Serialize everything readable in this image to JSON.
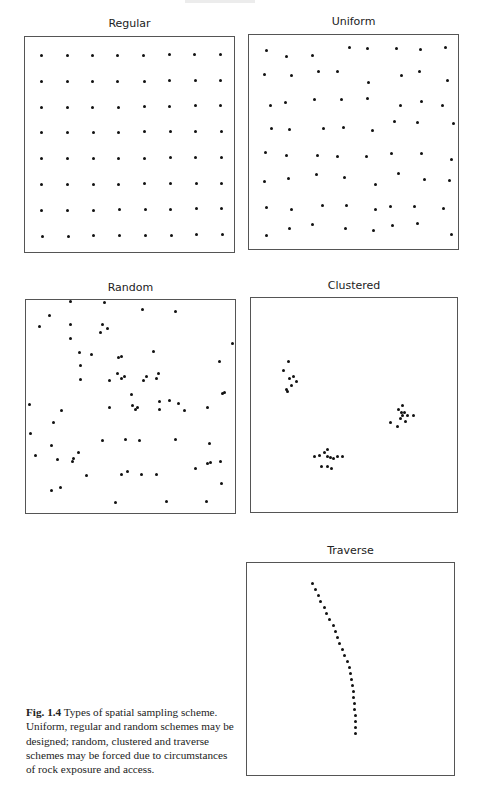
{
  "figure": {
    "caption_label": "Fig. 1.4",
    "caption_text": " Types of spatial sampling scheme. Uniform, regular and random schemes may be designed; random, clustered and traverse schemes may be forced due to circumstances of rock exposure and access."
  },
  "panels": [
    {
      "id": "regular",
      "title": "Regular",
      "box": {
        "x": 24,
        "y": 36,
        "w": 211,
        "h": 217
      },
      "title_pos": {
        "x": 24,
        "y": 17,
        "w": 211
      }
    },
    {
      "id": "uniform",
      "title": "Uniform",
      "box": {
        "x": 248,
        "y": 34,
        "w": 211,
        "h": 216
      },
      "title_pos": {
        "x": 248,
        "y": 15,
        "w": 211
      }
    },
    {
      "id": "random",
      "title": "Random",
      "box": {
        "x": 25,
        "y": 299,
        "w": 211,
        "h": 215
      },
      "title_pos": {
        "x": 25,
        "y": 281,
        "w": 211
      }
    },
    {
      "id": "clustered",
      "title": "Clustered",
      "box": {
        "x": 250,
        "y": 297,
        "w": 208,
        "h": 216
      },
      "title_pos": {
        "x": 250,
        "y": 279,
        "w": 208
      }
    },
    {
      "id": "traverse",
      "title": "Traverse",
      "box": {
        "x": 246,
        "y": 562,
        "w": 209,
        "h": 214
      },
      "title_pos": {
        "x": 246,
        "y": 544,
        "w": 209
      }
    }
  ],
  "chart_data": [
    {
      "type": "scatter",
      "title": "Regular",
      "grid": false,
      "points": [
        [
          40,
          54
        ],
        [
          66,
          54
        ],
        [
          91,
          54
        ],
        [
          116,
          54
        ],
        [
          142,
          54
        ],
        [
          168,
          53
        ],
        [
          193,
          53
        ],
        [
          219,
          53
        ],
        [
          40,
          80
        ],
        [
          66,
          80
        ],
        [
          91,
          80
        ],
        [
          116,
          80
        ],
        [
          143,
          80
        ],
        [
          168,
          79
        ],
        [
          194,
          79
        ],
        [
          219,
          79
        ],
        [
          40,
          106
        ],
        [
          66,
          106
        ],
        [
          91,
          106
        ],
        [
          117,
          106
        ],
        [
          143,
          105
        ],
        [
          168,
          105
        ],
        [
          194,
          104
        ],
        [
          219,
          104
        ],
        [
          40,
          131
        ],
        [
          66,
          131
        ],
        [
          92,
          131
        ],
        [
          117,
          131
        ],
        [
          143,
          130
        ],
        [
          169,
          130
        ],
        [
          194,
          130
        ],
        [
          220,
          130
        ],
        [
          40,
          157
        ],
        [
          66,
          157
        ],
        [
          92,
          157
        ],
        [
          117,
          157
        ],
        [
          143,
          157
        ],
        [
          169,
          156
        ],
        [
          194,
          156
        ],
        [
          220,
          156
        ],
        [
          40,
          183
        ],
        [
          66,
          183
        ],
        [
          92,
          183
        ],
        [
          117,
          183
        ],
        [
          143,
          182
        ],
        [
          169,
          182
        ],
        [
          195,
          182
        ],
        [
          220,
          182
        ],
        [
          40,
          209
        ],
        [
          66,
          209
        ],
        [
          92,
          209
        ],
        [
          118,
          208
        ],
        [
          144,
          208
        ],
        [
          169,
          208
        ],
        [
          195,
          207
        ],
        [
          220,
          207
        ],
        [
          41,
          235
        ],
        [
          67,
          235
        ],
        [
          92,
          234
        ],
        [
          118,
          234
        ],
        [
          144,
          234
        ],
        [
          170,
          234
        ],
        [
          195,
          233
        ],
        [
          221,
          233
        ]
      ]
    },
    {
      "type": "scatter",
      "title": "Uniform",
      "grid": false,
      "points": [
        [
          265,
          49
        ],
        [
          285,
          55
        ],
        [
          311,
          54
        ],
        [
          348,
          46
        ],
        [
          366,
          47
        ],
        [
          395,
          47
        ],
        [
          419,
          48
        ],
        [
          444,
          46
        ],
        [
          263,
          73
        ],
        [
          290,
          74
        ],
        [
          317,
          70
        ],
        [
          336,
          70
        ],
        [
          367,
          81
        ],
        [
          400,
          74
        ],
        [
          418,
          70
        ],
        [
          446,
          79
        ],
        [
          269,
          104
        ],
        [
          284,
          101
        ],
        [
          313,
          98
        ],
        [
          340,
          98
        ],
        [
          366,
          97
        ],
        [
          399,
          104
        ],
        [
          420,
          100
        ],
        [
          441,
          104
        ],
        [
          270,
          127
        ],
        [
          288,
          128
        ],
        [
          322,
          127
        ],
        [
          342,
          126
        ],
        [
          371,
          129
        ],
        [
          393,
          120
        ],
        [
          416,
          121
        ],
        [
          452,
          122
        ],
        [
          264,
          151
        ],
        [
          285,
          154
        ],
        [
          316,
          154
        ],
        [
          336,
          155
        ],
        [
          365,
          155
        ],
        [
          390,
          152
        ],
        [
          420,
          152
        ],
        [
          450,
          158
        ],
        [
          263,
          180
        ],
        [
          287,
          177
        ],
        [
          315,
          173
        ],
        [
          343,
          176
        ],
        [
          374,
          183
        ],
        [
          397,
          172
        ],
        [
          423,
          178
        ],
        [
          448,
          179
        ],
        [
          265,
          206
        ],
        [
          290,
          208
        ],
        [
          321,
          204
        ],
        [
          345,
          204
        ],
        [
          374,
          208
        ],
        [
          389,
          205
        ],
        [
          413,
          205
        ],
        [
          442,
          207
        ],
        [
          265,
          234
        ],
        [
          288,
          227
        ],
        [
          311,
          223
        ],
        [
          344,
          227
        ],
        [
          372,
          229
        ],
        [
          391,
          224
        ],
        [
          416,
          222
        ],
        [
          450,
          233
        ]
      ]
    },
    {
      "type": "scatter",
      "title": "Random",
      "grid": false,
      "points": [
        [
          69,
          300
        ],
        [
          103,
          301
        ],
        [
          48,
          314
        ],
        [
          141,
          308
        ],
        [
          174,
          310
        ],
        [
          38,
          325
        ],
        [
          69,
          323
        ],
        [
          101,
          323
        ],
        [
          106,
          327
        ],
        [
          99,
          331
        ],
        [
          69,
          337
        ],
        [
          231,
          342
        ],
        [
          78,
          351
        ],
        [
          90,
          353
        ],
        [
          117,
          356
        ],
        [
          120,
          355
        ],
        [
          152,
          350
        ],
        [
          116,
          372
        ],
        [
          79,
          364
        ],
        [
          79,
          378
        ],
        [
          120,
          377
        ],
        [
          123,
          375
        ],
        [
          145,
          375
        ],
        [
          142,
          379
        ],
        [
          218,
          360
        ],
        [
          108,
          379
        ],
        [
          130,
          393
        ],
        [
          155,
          377
        ],
        [
          157,
          372
        ],
        [
          221,
          392
        ],
        [
          223,
          391
        ],
        [
          28,
          403
        ],
        [
          60,
          409
        ],
        [
          108,
          406
        ],
        [
          131,
          404
        ],
        [
          134,
          408
        ],
        [
          136,
          406
        ],
        [
          158,
          400
        ],
        [
          158,
          408
        ],
        [
          168,
          399
        ],
        [
          183,
          409
        ],
        [
          177,
          402
        ],
        [
          206,
          406
        ],
        [
          52,
          421
        ],
        [
          29,
          432
        ],
        [
          101,
          439
        ],
        [
          124,
          438
        ],
        [
          138,
          439
        ],
        [
          174,
          438
        ],
        [
          208,
          442
        ],
        [
          50,
          444
        ],
        [
          77,
          451
        ],
        [
          72,
          457
        ],
        [
          34,
          454
        ],
        [
          71,
          460
        ],
        [
          56,
          458
        ],
        [
          85,
          474
        ],
        [
          120,
          473
        ],
        [
          126,
          470
        ],
        [
          140,
          473
        ],
        [
          155,
          473
        ],
        [
          194,
          467
        ],
        [
          206,
          462
        ],
        [
          209,
          461
        ],
        [
          219,
          460
        ],
        [
          220,
          482
        ],
        [
          50,
          489
        ],
        [
          59,
          486
        ],
        [
          114,
          501
        ],
        [
          165,
          500
        ],
        [
          205,
          500
        ]
      ]
    },
    {
      "type": "scatter",
      "title": "Clustered",
      "grid": false,
      "clusters": [
        {
          "name": "upper-left",
          "points": [
            [
              287,
              360
            ],
            [
              282,
              369
            ],
            [
              288,
              377
            ],
            [
              292,
              375
            ],
            [
              295,
              380
            ],
            [
              290,
              384
            ],
            [
              285,
              388
            ],
            [
              286,
              390
            ]
          ]
        },
        {
          "name": "right",
          "points": [
            [
              401,
              404
            ],
            [
              397,
              408
            ],
            [
              400,
              411
            ],
            [
              403,
              411
            ],
            [
              401,
              414
            ],
            [
              406,
              414
            ],
            [
              412,
              414
            ],
            [
              389,
              421
            ],
            [
              396,
              425
            ],
            [
              404,
              420
            ],
            [
              399,
              417
            ]
          ]
        },
        {
          "name": "lower-middle",
          "points": [
            [
              326,
              448
            ],
            [
              323,
              451
            ],
            [
              313,
              455
            ],
            [
              318,
              454
            ],
            [
              326,
              455
            ],
            [
              329,
              456
            ],
            [
              332,
              457
            ],
            [
              336,
              455
            ],
            [
              341,
              455
            ],
            [
              320,
              465
            ],
            [
              326,
              465
            ],
            [
              330,
              467
            ]
          ]
        }
      ]
    },
    {
      "type": "scatter",
      "title": "Traverse",
      "grid": false,
      "points": [
        [
          311,
          582
        ],
        [
          314,
          588
        ],
        [
          317,
          594
        ],
        [
          319,
          600
        ],
        [
          323,
          606
        ],
        [
          325,
          612
        ],
        [
          328,
          618
        ],
        [
          332,
          624
        ],
        [
          334,
          630
        ],
        [
          336,
          636
        ],
        [
          338,
          642
        ],
        [
          341,
          648
        ],
        [
          343,
          654
        ],
        [
          346,
          660
        ],
        [
          348,
          666
        ],
        [
          349,
          672
        ],
        [
          350,
          678
        ],
        [
          351,
          684
        ],
        [
          352,
          690
        ],
        [
          352,
          696
        ],
        [
          353,
          702
        ],
        [
          353,
          708
        ],
        [
          354,
          714
        ],
        [
          354,
          720
        ],
        [
          354,
          726
        ],
        [
          354,
          732
        ]
      ]
    }
  ]
}
